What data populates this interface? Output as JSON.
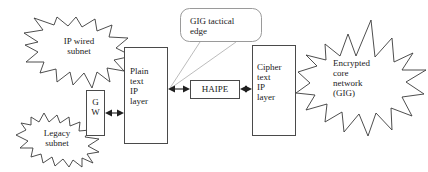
{
  "diagram": {
    "canvas": {
      "width": 428,
      "height": 172,
      "background": "#ffffff"
    },
    "colors": {
      "shape_outline": "#3a3a3a",
      "box_outline": "#4a4a4a",
      "callout_outline": "#8f8f8f",
      "leader_line": "#b4b4b4",
      "connector": "#202020",
      "text": "#1a1a1a"
    },
    "clouds": [
      {
        "id": "ip-wired-subnet",
        "label": "IP wired\nsubnet",
        "shape": "explosion-star",
        "x": 24,
        "y": 17,
        "width": 108,
        "height": 73
      },
      {
        "id": "legacy-subnet",
        "label": "Legacy\nsubnet",
        "shape": "explosion-star",
        "x": 16,
        "y": 111,
        "width": 84,
        "height": 56
      },
      {
        "id": "encrypted-core-network",
        "label": "Encrypted\ncore\nnetwork\n(GIG)",
        "shape": "explosion-star",
        "x": 298,
        "y": 20,
        "width": 128,
        "height": 128
      }
    ],
    "boxes": [
      {
        "id": "gw",
        "label": "G\nW",
        "x": 86,
        "y": 90,
        "width": 19,
        "height": 46
      },
      {
        "id": "plain-text-ip-layer",
        "label": "Plain\ntext\nIP\nlayer",
        "x": 124,
        "y": 47,
        "width": 44,
        "height": 97
      },
      {
        "id": "haipe",
        "label": "HAIPE",
        "x": 190,
        "y": 80,
        "width": 50,
        "height": 19
      },
      {
        "id": "cipher-text-ip-layer",
        "label": "Cipher\ntext\nIP\nlayer",
        "x": 252,
        "y": 45,
        "width": 44,
        "height": 91
      }
    ],
    "callout": {
      "id": "gig-tactical-edge",
      "label": "GIG tactical\nedge",
      "x": 180,
      "y": 8,
      "width": 82,
      "height": 34,
      "corner_radius": 9,
      "leader_target_x": 170,
      "leader_target_y": 88
    },
    "connectors": [
      {
        "id": "legacy-to-gw",
        "from": "legacy-subnet",
        "to": "gw",
        "arrow": "none",
        "style": "implicit-overlap"
      },
      {
        "id": "ip-wired-to-plain-text",
        "from": "ip-wired-subnet",
        "to": "plain-text-ip-layer",
        "arrow": "none",
        "style": "implicit-overlap"
      },
      {
        "id": "gw-to-plain-text",
        "from": "gw",
        "to": "plain-text-ip-layer",
        "arrow": "double",
        "x1": 105,
        "y1": 113,
        "x2": 124,
        "y2": 113
      },
      {
        "id": "plain-text-to-haipe",
        "from": "plain-text-ip-layer",
        "to": "haipe",
        "arrow": "double",
        "x1": 168,
        "y1": 89,
        "x2": 190,
        "y2": 89
      },
      {
        "id": "haipe-to-cipher-text",
        "from": "haipe",
        "to": "cipher-text-ip-layer",
        "arrow": "double",
        "x1": 240,
        "y1": 89,
        "x2": 252,
        "y2": 89
      },
      {
        "id": "cipher-text-to-encrypted-core",
        "from": "cipher-text-ip-layer",
        "to": "encrypted-core-network",
        "arrow": "none",
        "style": "implicit-overlap"
      }
    ]
  }
}
